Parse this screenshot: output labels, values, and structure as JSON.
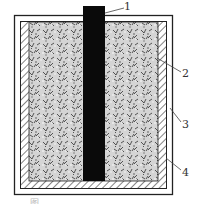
{
  "diagram": {
    "type": "cross-section schematic",
    "components": [
      {
        "id": "1",
        "label": "1",
        "part": "central-electrode"
      },
      {
        "id": "2",
        "label": "2",
        "part": "granular-fill"
      },
      {
        "id": "3",
        "label": "3",
        "part": "outer-container-wall"
      },
      {
        "id": "4",
        "label": "4",
        "part": "hatched-lining"
      }
    ],
    "caption": "图 … … … … …"
  },
  "colors": {
    "electrode": "#0a0a0a",
    "fill_base": "#d9d9d9",
    "lines": "#222222"
  }
}
